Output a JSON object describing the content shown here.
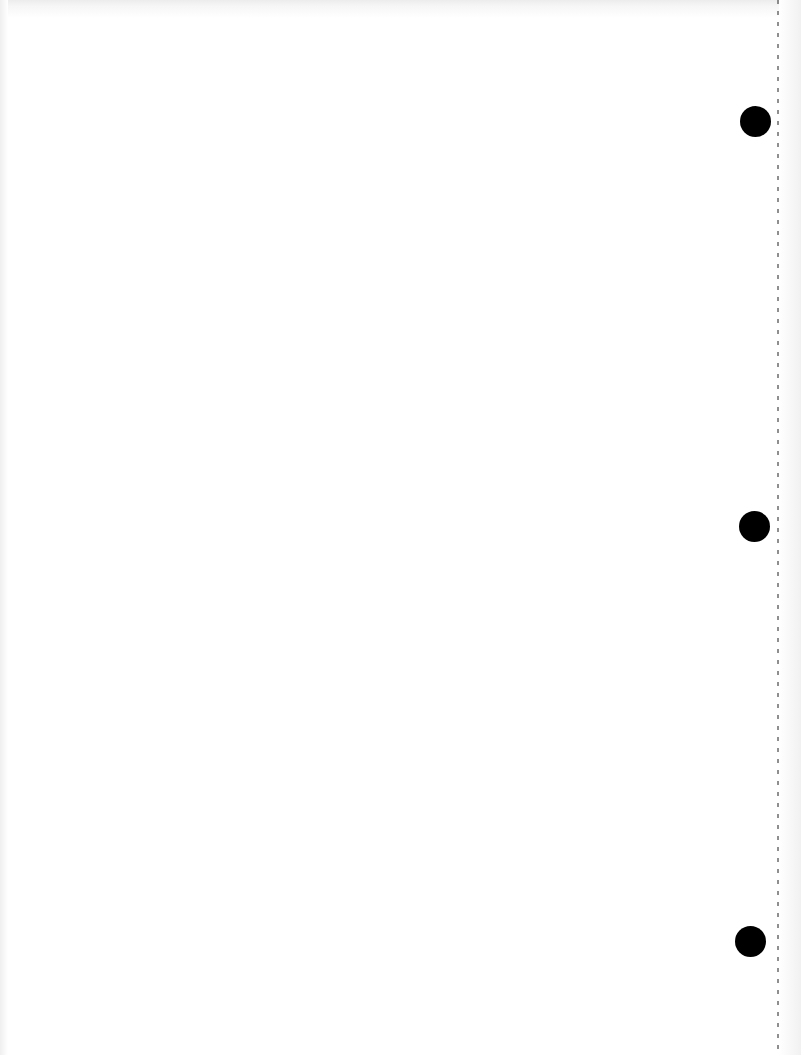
{
  "document": {
    "type": "blank scanned page (reverse side)",
    "background_color": "#ffffff",
    "text_content": ""
  },
  "hole_punches": [
    {
      "center_x": 755,
      "center_y": 121,
      "radius": 15,
      "color": "#000000"
    },
    {
      "center_x": 754,
      "center_y": 526,
      "radius": 15,
      "color": "#000000"
    },
    {
      "center_x": 750,
      "center_y": 941,
      "radius": 15,
      "color": "#000000"
    }
  ],
  "perforation_line": {
    "x": 778,
    "style": "dashed",
    "color": "#6a6a6a"
  }
}
